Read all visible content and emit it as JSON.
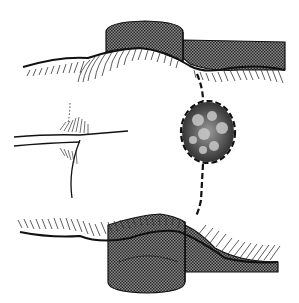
{
  "figure": {
    "type": "surgical-illustration",
    "caption": "",
    "colors": {
      "background": "#ffffff",
      "ink": "#111111",
      "retractor_fill": "#6a6a6a",
      "lesion_fill": "#3a3a3a",
      "lesion_highlight": "#d8d8d8"
    },
    "elements": [
      {
        "name": "upper-retractor",
        "label": ""
      },
      {
        "name": "lower-retractor",
        "label": ""
      },
      {
        "name": "buttocks-tissue",
        "label": ""
      },
      {
        "name": "anal-cleft",
        "label": ""
      },
      {
        "name": "lesion",
        "label": ""
      },
      {
        "name": "incision-line",
        "label": ""
      }
    ]
  }
}
